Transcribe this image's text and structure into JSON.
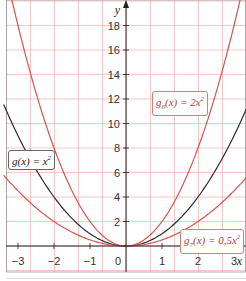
{
  "chart_data": {
    "type": "line",
    "title": "",
    "xlabel": "x",
    "ylabel": "y",
    "xlim": [
      -3.3,
      3.3
    ],
    "ylim": [
      -2,
      20
    ],
    "x_ticks": [
      -3,
      -2,
      -1,
      0,
      1,
      2,
      3
    ],
    "x_tick_labels": [
      "−3",
      "−2",
      "−1",
      "0",
      "1",
      "2",
      "3"
    ],
    "y_ticks": [
      2,
      4,
      6,
      8,
      10,
      12,
      14,
      16,
      18
    ],
    "y_tick_labels": [
      "2",
      "4",
      "6",
      "8",
      "10",
      "12",
      "14",
      "16",
      "18"
    ],
    "grid": true,
    "grid_color": "#f2b8b4",
    "series": [
      {
        "name": "g(x) = x²",
        "formula": "x^2",
        "coefficient": 1,
        "color": "#2b2b2b",
        "x": [
          -3.3,
          -3,
          -2,
          -1,
          0,
          1,
          2,
          3,
          3.3
        ],
        "values": [
          10.89,
          9,
          4,
          1,
          0,
          1,
          4,
          9,
          10.89
        ]
      },
      {
        "name": "g6(x) = 2x²",
        "formula": "2x^2",
        "coefficient": 2,
        "color": "#d9534f",
        "x": [
          -3,
          -2,
          -1,
          0,
          1,
          2,
          3
        ],
        "values": [
          18,
          8,
          2,
          0,
          2,
          8,
          18
        ]
      },
      {
        "name": "g7(x) = 0,5x²",
        "formula": "0.5x^2",
        "coefficient": 0.5,
        "color": "#d9534f",
        "x": [
          -3.3,
          -3,
          -2,
          -1,
          0,
          1,
          2,
          3,
          3.3
        ],
        "values": [
          5.445,
          4.5,
          2,
          0.5,
          0,
          0.5,
          2,
          4.5,
          5.445
        ]
      }
    ],
    "annotations": [
      {
        "text": "g(x) = x²",
        "series": 0
      },
      {
        "text": "g6(x) = 2x²",
        "series": 1
      },
      {
        "text": "g7(x) = 0,5x²",
        "series": 2
      }
    ]
  },
  "labels": {
    "g": {
      "name": "g",
      "sub": "",
      "arg": "(x) = ",
      "coef": "",
      "var": "x",
      "exp": "2"
    },
    "g6": {
      "name": "g",
      "sub": "6",
      "arg": "(x) = ",
      "coef": "2",
      "var": "x",
      "exp": "2"
    },
    "g7": {
      "name": "g",
      "sub": "7",
      "arg": "(x) = ",
      "coef": "0,5",
      "var": "x",
      "exp": "2"
    }
  },
  "axes": {
    "x_name": "x",
    "y_name": "y"
  }
}
